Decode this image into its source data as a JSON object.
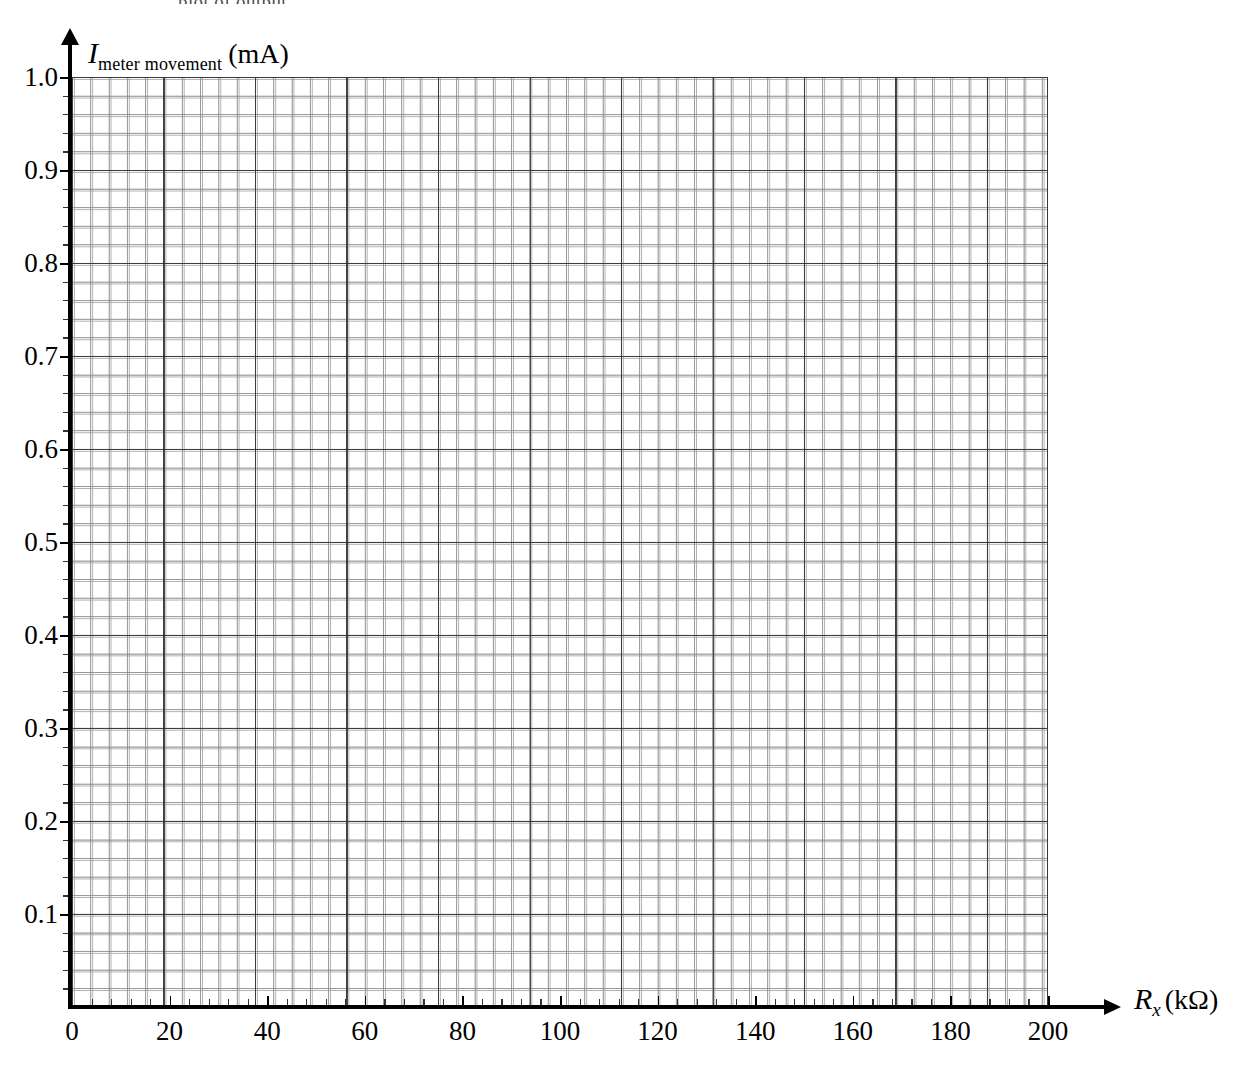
{
  "top_caption": "plot of output",
  "chart_data": {
    "type": "line",
    "title": "",
    "subtitle": "",
    "xlabel_var": "R",
    "xlabel_sub": "x",
    "xlabel_unit": "(kΩ)",
    "xlabel": "R_x (kΩ)",
    "ylabel_var": "I",
    "ylabel_sub": "meter movement",
    "ylabel_unit": "(mA)",
    "ylabel": "I_meter movement (mA)",
    "xlim": [
      0,
      200
    ],
    "ylim": [
      0,
      1.0
    ],
    "x_ticks": [
      0,
      20,
      40,
      60,
      80,
      100,
      120,
      140,
      160,
      180,
      200
    ],
    "x_tick_labels": [
      "0",
      "20",
      "40",
      "60",
      "80",
      "100",
      "120",
      "140",
      "160",
      "180",
      "200"
    ],
    "y_ticks": [
      0.1,
      0.2,
      0.3,
      0.4,
      0.5,
      0.6,
      0.7,
      0.8,
      0.9,
      1.0
    ],
    "y_tick_labels": [
      "0.1",
      "0.2",
      "0.3",
      "0.4",
      "0.5",
      "0.6",
      "0.7",
      "0.8",
      "0.9",
      "1.0"
    ],
    "grid": true,
    "grid_style": "graph-paper",
    "minor_divisions_per_major": 5,
    "major_x_step": 20,
    "major_y_step": 0.1,
    "minor_x_step": 4,
    "minor_y_step": 0.02,
    "legend": [],
    "series": [],
    "annotations": [],
    "note": "Blank graph paper — no data plotted",
    "colors": {
      "background": "#ffffff",
      "axis": "#000000",
      "major_grid": "#2a2a2a",
      "minor_grid": "#7a7a7a",
      "text": "#000000"
    }
  },
  "axis_titles": {
    "y_var": "I",
    "y_sub": "meter movement",
    "y_unit": "(mA)",
    "x_var": "R",
    "x_sub": "x",
    "x_unit": "(kΩ)"
  }
}
